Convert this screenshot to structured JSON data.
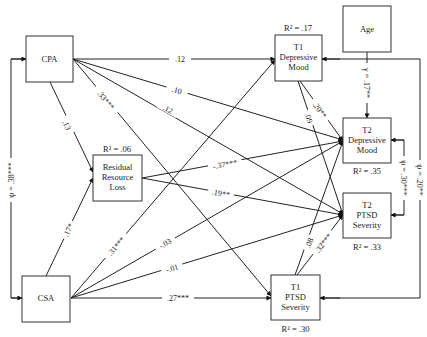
{
  "diagram": {
    "nodes": {
      "cpa": {
        "lines": [
          "CPA"
        ]
      },
      "csa": {
        "lines": [
          "CSA"
        ]
      },
      "rrl": {
        "lines": [
          "Residual",
          "Resource",
          "Loss"
        ],
        "r2": "R² = .06"
      },
      "t1dep": {
        "lines": [
          "T1",
          "Depressive",
          "Mood"
        ],
        "r2": "R² = .17"
      },
      "age": {
        "lines": [
          "Age"
        ]
      },
      "t2dep": {
        "lines": [
          "T2",
          "Depressive",
          "Mood"
        ],
        "r2": "R² = .35"
      },
      "t2ptsd": {
        "lines": [
          "T2",
          "PTSD",
          "Severity"
        ],
        "r2": "R² = .33"
      },
      "t1ptsd": {
        "lines": [
          "T1",
          "PTSD",
          "Severity"
        ],
        "r2": "R² = .30"
      }
    },
    "paths": {
      "cpa_t1dep": ".12",
      "cpa_t2dep": ".10",
      "cpa_t2ptsd": ".12",
      "cpa_t1ptsd": ".33***",
      "cpa_rrl": ".13",
      "csa_rrl": ".17*",
      "csa_t1dep": ".31***",
      "csa_t2dep": "-.03",
      "csa_t2ptsd": "-.01",
      "csa_t1ptsd": ".27***",
      "rrl_t2dep": "-.37***",
      "rrl_t2ptsd": ".19**",
      "t1dep_t2dep": ".20**",
      "t1dep_t2ptsd": ".09",
      "t1ptsd_t2dep": ".08",
      "t1ptsd_t2ptsd": ".32***",
      "age_t2dep": "γ = .17**",
      "cov_cpa_csa": "ψ = .38***",
      "cov_t2dep_t2ptsd": "ψ = .30***",
      "cov_t1dep_t1ptsd": "ψ = .20**"
    }
  }
}
